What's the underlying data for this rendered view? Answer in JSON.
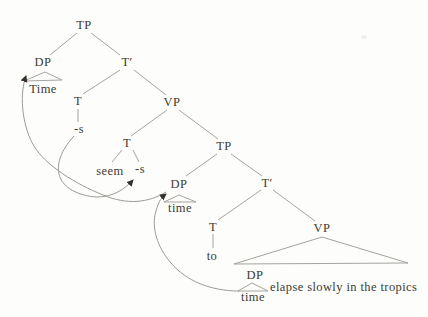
{
  "tree": {
    "labels": {
      "tp_root": "TP",
      "dp_matrix": "DP",
      "time_matrix": "Time",
      "tbar_matrix": "T′",
      "t_matrix": "T",
      "s_matrix": "-s",
      "vp_matrix": "VP",
      "t_seem": "T",
      "seem": "seem",
      "s_seem": "-s",
      "tp_embedded": "TP",
      "dp_embedded": "DP",
      "time_embedded": "time",
      "tbar_embedded": "T′",
      "t_embedded": "T",
      "to": "to",
      "vp_embedded": "VP",
      "dp_lowest": "DP",
      "time_lowest": "time",
      "vp_phrase": "elapse slowly in the tropics"
    }
  },
  "colors": {
    "background": "#fdfdfb",
    "branch_line": "#9b9893",
    "arrow_line": "#918e89",
    "arrowhead": "#35312c",
    "text": "#3e3a33"
  }
}
